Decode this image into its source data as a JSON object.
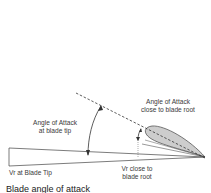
{
  "diagram": {
    "labels": {
      "aoa_root_line1": "Angle of Attack",
      "aoa_root_line2": "close to blade root",
      "aoa_tip_line1": "Angle of Attack",
      "aoa_tip_line2": "at blade tip",
      "vr_tip": "Vr at Blade Tip",
      "vr_root_line1": "Vr close to",
      "vr_root_line2": "blade root"
    },
    "caption": "Blade angle of attack",
    "colors": {
      "line": "#333333",
      "hatch": "#555555",
      "background": "#ffffff"
    }
  }
}
